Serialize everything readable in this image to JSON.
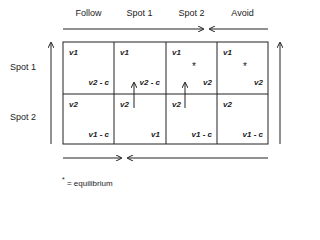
{
  "columns": [
    "Follow",
    "Spot 1",
    "Spot 2",
    "Avoid"
  ],
  "rows": [
    "Spot 1",
    "Spot 2"
  ],
  "cells": [
    [
      {
        "top_left": "v1",
        "bottom_right": "v2 - c",
        "equilibrium": false
      },
      {
        "top_left": "v1",
        "bottom_right": "v2 - c",
        "equilibrium": false
      },
      {
        "top_left": "v1",
        "bottom_right": "v2",
        "equilibrium": true
      },
      {
        "top_left": "v1",
        "bottom_right": "v2",
        "equilibrium": true
      }
    ],
    [
      {
        "top_left": "v2",
        "bottom_right": "v1 - c",
        "equilibrium": false
      },
      {
        "top_left": "v2",
        "bottom_right": "v1",
        "equilibrium": false
      },
      {
        "top_left": "v2",
        "bottom_right": "v1 - c",
        "equilibrium": false
      },
      {
        "top_left": "v2",
        "bottom_right": "v1 - c",
        "equilibrium": false
      }
    ]
  ],
  "star_symbol": "*",
  "legend": {
    "symbol": "*",
    "text": "= equilibrium"
  }
}
